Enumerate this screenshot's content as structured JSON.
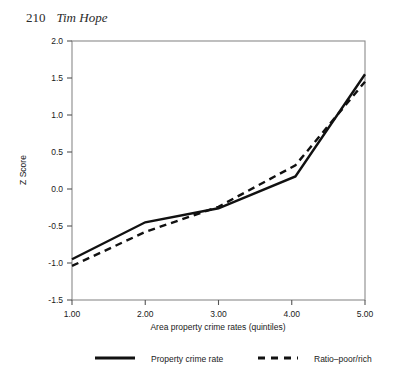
{
  "page_header": {
    "folio": "210",
    "author": "Tim Hope"
  },
  "chart_data": {
    "type": "line",
    "title": "",
    "xlabel": "Area property crime rates (quintiles)",
    "ylabel": "Z Score",
    "xlim": [
      1.0,
      5.0
    ],
    "ylim": [
      -1.5,
      2.0
    ],
    "xticks": [
      1.0,
      2.0,
      3.0,
      4.0,
      5.0
    ],
    "xtick_labels": [
      "1.00",
      "2.00",
      "3.00",
      "4.00",
      "5.00"
    ],
    "yticks": [
      -1.5,
      -1.0,
      -0.5,
      0.0,
      0.5,
      1.0,
      1.5,
      2.0
    ],
    "ytick_labels": [
      "-1.5",
      "-1.0",
      "-0.5",
      "0.0",
      "0.5",
      "1.0",
      "1.5",
      "2.0"
    ],
    "grid": false,
    "legend_position": "below",
    "x": [
      1.0,
      2.0,
      3.0,
      4.05,
      5.0
    ],
    "series": [
      {
        "name": "Property crime rate",
        "style": "solid",
        "color": "#111111",
        "values": [
          -0.95,
          -0.45,
          -0.26,
          0.17,
          1.55
        ]
      },
      {
        "name": "Ratio–poor/rich",
        "style": "dashed",
        "color": "#111111",
        "values": [
          -1.04,
          -0.58,
          -0.24,
          0.32,
          1.45
        ]
      }
    ],
    "legend": [
      {
        "label": "Property crime rate",
        "style": "solid"
      },
      {
        "label": "Ratio–poor/rich",
        "style": "dashed"
      }
    ]
  }
}
